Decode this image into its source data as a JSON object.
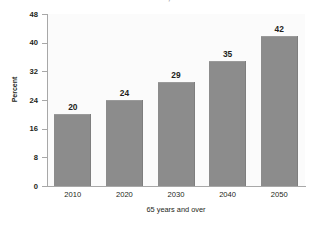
{
  "chart_data": {
    "type": "bar",
    "title": "AND OLDER, 2010-2050",
    "xlabel": "65 years and over",
    "ylabel": "Percent",
    "categories": [
      "2010",
      "2020",
      "2030",
      "2040",
      "2050"
    ],
    "values": [
      20,
      24,
      29,
      35,
      42
    ],
    "value_labels": [
      "20",
      "24",
      "29",
      "35",
      "42"
    ],
    "ylim": [
      0,
      48
    ],
    "yticks": [
      0,
      8,
      16,
      24,
      32,
      40,
      48
    ],
    "ytick_labels": [
      "0",
      "8",
      "16",
      "24",
      "32",
      "40",
      "48"
    ],
    "grid": false,
    "legend": "none",
    "bar_color": "#8c8c8c",
    "plot_background": "#fbfbfb",
    "axis_color": "#a8a8a8"
  }
}
